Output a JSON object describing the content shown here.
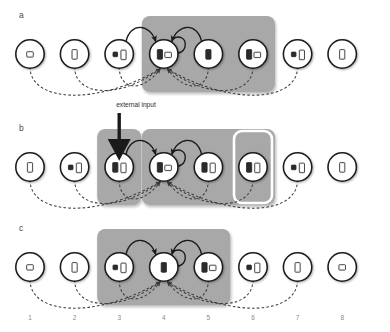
{
  "figure": {
    "type": "diagram",
    "background": "#ffffff",
    "colors": {
      "node_stroke": "#1a1a1a",
      "glyph_dark": "#2b2b2b",
      "glyph_light": "#f2f2f2",
      "box_grey": "#a8a8a8",
      "box_white_outline": "#ffffff",
      "arrow_solid": "#1a1a1a",
      "arrow_dashed": "#3c3c3c",
      "ext_arrow": "#1a1a1a",
      "axis_text": "#8a8a8a",
      "panel_letter": "#4a4a4a"
    }
  },
  "axis": {
    "name": "node-index-axis",
    "labels": [
      "1",
      "2",
      "3",
      "4",
      "5",
      "6",
      "7",
      "8"
    ]
  },
  "external_input": {
    "label": "external input",
    "target_node": 3,
    "panel": "b"
  },
  "panels": [
    {
      "letter": "a",
      "row_y": 54,
      "boxes": [
        {
          "name": "grey-box-a",
          "from": 4,
          "to": 6,
          "style": "grey"
        }
      ],
      "nodes": [
        {
          "index": 1,
          "glyphs": [
            {
              "kind": "tablet",
              "fill": "light"
            }
          ]
        },
        {
          "index": 2,
          "glyphs": [
            {
              "kind": "phone",
              "fill": "light"
            }
          ]
        },
        {
          "index": 3,
          "glyphs": [
            {
              "kind": "small",
              "fill": "dark"
            },
            {
              "kind": "phone",
              "fill": "light"
            }
          ]
        },
        {
          "index": 4,
          "glyphs": [
            {
              "kind": "phone",
              "fill": "dark"
            },
            {
              "kind": "tablet",
              "fill": "light"
            }
          ]
        },
        {
          "index": 5,
          "glyphs": [
            {
              "kind": "phone",
              "fill": "dark"
            }
          ]
        },
        {
          "index": 6,
          "glyphs": [
            {
              "kind": "phone",
              "fill": "dark"
            },
            {
              "kind": "tablet",
              "fill": "light"
            }
          ]
        },
        {
          "index": 7,
          "glyphs": [
            {
              "kind": "small",
              "fill": "dark"
            },
            {
              "kind": "phone",
              "fill": "light"
            }
          ]
        },
        {
          "index": 8,
          "glyphs": [
            {
              "kind": "phone",
              "fill": "light"
            }
          ]
        }
      ],
      "solid_arrows": [
        {
          "from": 3,
          "to": 4,
          "curve": "over"
        },
        {
          "from": 5,
          "to": 4,
          "curve": "over"
        },
        {
          "from": 4,
          "to": 4,
          "curve": "loop"
        }
      ],
      "dashed_arrows": [
        {
          "from": 1,
          "to": 4
        },
        {
          "from": 2,
          "to": 4
        },
        {
          "from": 3,
          "to": 4
        },
        {
          "from": 5,
          "to": 4
        },
        {
          "from": 6,
          "to": 4
        },
        {
          "from": 7,
          "to": 4
        }
      ]
    },
    {
      "letter": "b",
      "row_y": 167,
      "boxes": [
        {
          "name": "grey-box-b-left",
          "from": 3,
          "to": 3,
          "style": "grey"
        },
        {
          "name": "grey-box-b-right",
          "from": 4,
          "to": 6,
          "style": "grey"
        },
        {
          "name": "white-box-b-node6",
          "from": 6,
          "to": 6,
          "style": "white-outline"
        }
      ],
      "nodes": [
        {
          "index": 1,
          "glyphs": [
            {
              "kind": "phone",
              "fill": "light"
            }
          ]
        },
        {
          "index": 2,
          "glyphs": [
            {
              "kind": "small",
              "fill": "dark"
            },
            {
              "kind": "phone",
              "fill": "light"
            }
          ]
        },
        {
          "index": 3,
          "glyphs": [
            {
              "kind": "phone",
              "fill": "dark"
            },
            {
              "kind": "phone",
              "fill": "light"
            }
          ]
        },
        {
          "index": 4,
          "glyphs": [
            {
              "kind": "phone",
              "fill": "dark"
            },
            {
              "kind": "tablet",
              "fill": "light"
            }
          ]
        },
        {
          "index": 5,
          "glyphs": [
            {
              "kind": "phone",
              "fill": "dark"
            },
            {
              "kind": "phone",
              "fill": "light"
            }
          ]
        },
        {
          "index": 6,
          "glyphs": [
            {
              "kind": "phone",
              "fill": "dark"
            },
            {
              "kind": "phone",
              "fill": "light"
            }
          ]
        },
        {
          "index": 7,
          "glyphs": [
            {
              "kind": "small",
              "fill": "dark"
            },
            {
              "kind": "phone",
              "fill": "light"
            }
          ]
        },
        {
          "index": 8,
          "glyphs": [
            {
              "kind": "phone",
              "fill": "light"
            }
          ]
        }
      ],
      "solid_arrows": [
        {
          "from": 3,
          "to": 4,
          "curve": "over"
        },
        {
          "from": 5,
          "to": 4,
          "curve": "over"
        },
        {
          "from": 4,
          "to": 4,
          "curve": "loop"
        }
      ],
      "dashed_arrows": [
        {
          "from": 1,
          "to": 4
        },
        {
          "from": 2,
          "to": 4
        },
        {
          "from": 3,
          "to": 4
        },
        {
          "from": 5,
          "to": 4
        },
        {
          "from": 6,
          "to": 4
        },
        {
          "from": 7,
          "to": 4
        }
      ]
    },
    {
      "letter": "c",
      "row_y": 267,
      "boxes": [
        {
          "name": "grey-box-c",
          "from": 3,
          "to": 5,
          "style": "grey"
        }
      ],
      "nodes": [
        {
          "index": 1,
          "glyphs": [
            {
              "kind": "tablet",
              "fill": "light"
            }
          ]
        },
        {
          "index": 2,
          "glyphs": [
            {
              "kind": "phone",
              "fill": "light"
            }
          ]
        },
        {
          "index": 3,
          "glyphs": [
            {
              "kind": "small",
              "fill": "dark"
            },
            {
              "kind": "phone",
              "fill": "light"
            }
          ]
        },
        {
          "index": 4,
          "glyphs": [
            {
              "kind": "phone",
              "fill": "dark"
            }
          ]
        },
        {
          "index": 5,
          "glyphs": [
            {
              "kind": "phone",
              "fill": "dark"
            },
            {
              "kind": "tablet",
              "fill": "light"
            }
          ]
        },
        {
          "index": 6,
          "glyphs": [
            {
              "kind": "small",
              "fill": "dark"
            },
            {
              "kind": "phone",
              "fill": "light"
            }
          ]
        },
        {
          "index": 7,
          "glyphs": [
            {
              "kind": "phone",
              "fill": "light"
            }
          ]
        },
        {
          "index": 8,
          "glyphs": [
            {
              "kind": "tablet",
              "fill": "light"
            }
          ]
        }
      ],
      "solid_arrows": [
        {
          "from": 3,
          "to": 4,
          "curve": "over"
        },
        {
          "from": 5,
          "to": 4,
          "curve": "over"
        },
        {
          "from": 4,
          "to": 4,
          "curve": "loop"
        }
      ],
      "dashed_arrows": [
        {
          "from": 1,
          "to": 4
        },
        {
          "from": 2,
          "to": 4
        },
        {
          "from": 3,
          "to": 4
        },
        {
          "from": 5,
          "to": 4
        },
        {
          "from": 6,
          "to": 4
        },
        {
          "from": 7,
          "to": 4
        }
      ]
    }
  ]
}
